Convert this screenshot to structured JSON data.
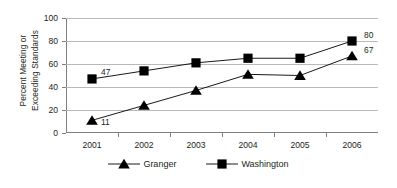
{
  "chart_data": {
    "type": "line",
    "title": "",
    "xlabel": "",
    "ylabel": "Percent Meeting or Exceeding Standards",
    "ylabel_line1": "Percent Meeting or",
    "ylabel_line2": "Exceeding Standards",
    "categories": [
      "2001",
      "2002",
      "2003",
      "2004",
      "2005",
      "2006"
    ],
    "ylim": [
      0,
      100
    ],
    "ytick_values": [
      "0",
      "20",
      "40",
      "60",
      "80",
      "100"
    ],
    "grid": true,
    "legend_position": "bottom",
    "series": [
      {
        "name": "Granger",
        "marker": "triangle",
        "color": "#000000",
        "values": [
          11,
          24,
          37,
          51,
          50,
          67
        ],
        "labeled_points": [
          {
            "category": "2001",
            "value": 11,
            "label": "11"
          },
          {
            "category": "2006",
            "value": 67,
            "label": "67"
          }
        ]
      },
      {
        "name": "Washington",
        "marker": "square",
        "color": "#000000",
        "values": [
          47,
          54,
          61,
          65,
          65,
          80
        ],
        "labeled_points": [
          {
            "category": "2001",
            "value": 47,
            "label": "47"
          },
          {
            "category": "2006",
            "value": 80,
            "label": "80"
          }
        ]
      }
    ]
  },
  "legend": {
    "items": [
      {
        "label": "Granger",
        "marker": "triangle-icon"
      },
      {
        "label": "Washington",
        "marker": "square-icon"
      }
    ]
  },
  "colors": {
    "axis": "#808080",
    "gridline": "#b9b9b9",
    "series": "#000000",
    "text": "#231f20",
    "background": "#ffffff"
  }
}
